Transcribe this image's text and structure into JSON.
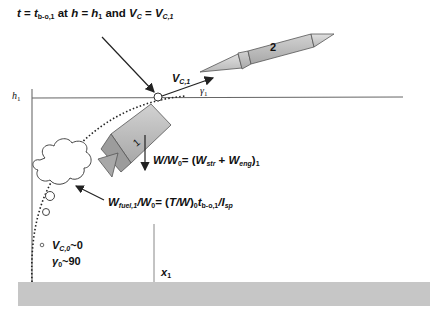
{
  "diagram": {
    "title": {
      "t": "t",
      "eq1": " = ",
      "t_b": "t",
      "t_b_sub": "b-o,1",
      "at": " at ",
      "h": "h",
      "eq2": " = ",
      "h1": "h",
      "h1_sub": "1",
      "and": " and ",
      "vc": "V",
      "vc_sub": "C",
      "eq3": " = ",
      "vc1": "V",
      "vc1_sub": "C,1"
    },
    "h1_axis_label": {
      "main": "h",
      "sub": "1"
    },
    "velocity_label": {
      "main": "V",
      "sub": "C,1"
    },
    "gamma1_label": {
      "main": "γ",
      "sub": "1"
    },
    "stage2_label": "2",
    "stage1_label": "1",
    "weight_eq": {
      "w": "W",
      "slash": "/",
      "w0": "W",
      "w0_sub": "0",
      "eq": "= (",
      "wstr": "W",
      "wstr_sub": "str",
      "plus": " + ",
      "weng": "W",
      "weng_sub": "eng",
      "close": ")",
      "close_sub": "1"
    },
    "fuel_eq": {
      "wf": "W",
      "wf_sub": "fuel,1",
      "slash": "/",
      "w0": "W",
      "w0_sub": "0",
      "eq": "= (",
      "tw": "T/W",
      "close": ")",
      "close_sub": "0",
      "tb": "t",
      "tb_sub": "b-o,1",
      "slash2": "/",
      "isp": "I",
      "isp_sub": "sp"
    },
    "initial_velocity": {
      "main": "V",
      "sub": "C,0",
      "rest": "~0"
    },
    "initial_angle": {
      "main": "γ",
      "sub": "0",
      "rest": "~90"
    },
    "x1_label": {
      "main": "x",
      "sub": "1"
    },
    "colors": {
      "ground": "#c8c8c8",
      "rocket_body": "#b4b4b4",
      "rocket_outline": "#444444",
      "line": "#555555",
      "text": "#111111"
    }
  }
}
